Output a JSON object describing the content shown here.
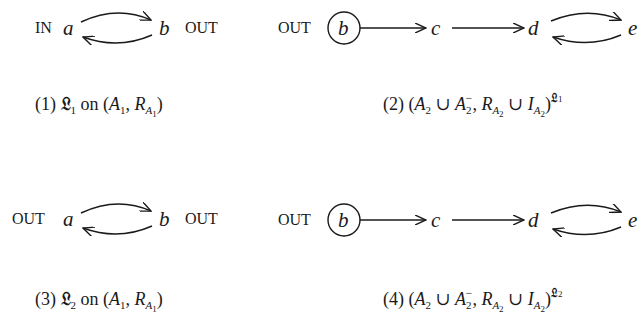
{
  "panels": [
    {
      "id": 1,
      "nodes": [
        {
          "name": "a",
          "label": "a",
          "status": "IN"
        },
        {
          "name": "b",
          "label": "b",
          "status": "OUT"
        }
      ],
      "edges": [
        [
          "a",
          "b"
        ],
        [
          "b",
          "a"
        ]
      ],
      "caption": {
        "number": "(1)",
        "labelling": "𝔏",
        "labelling_index": "1",
        "on": "on",
        "text": "(1) 𝔏1 on (A1, RA1)"
      }
    },
    {
      "id": 2,
      "nodes": [
        {
          "name": "b",
          "label": "b",
          "status": "OUT",
          "circled": true
        },
        {
          "name": "c",
          "label": "c"
        },
        {
          "name": "d",
          "label": "d"
        },
        {
          "name": "e",
          "label": "e"
        }
      ],
      "edges": [
        [
          "b",
          "c"
        ],
        [
          "c",
          "d"
        ],
        [
          "d",
          "e"
        ],
        [
          "e",
          "d"
        ]
      ],
      "caption": {
        "number": "(2)",
        "labelling": "𝔏",
        "labelling_index": "1",
        "text": "(2) (A2 ∪ A2⁻, RA2 ∪ IA2)^𝔏1"
      }
    },
    {
      "id": 3,
      "nodes": [
        {
          "name": "a",
          "label": "a",
          "status": "OUT"
        },
        {
          "name": "b",
          "label": "b",
          "status": "OUT"
        }
      ],
      "edges": [
        [
          "a",
          "b"
        ],
        [
          "b",
          "a"
        ]
      ],
      "caption": {
        "number": "(3)",
        "labelling": "𝔏",
        "labelling_index": "2",
        "on": "on",
        "text": "(3) 𝔏2 on (A1, RA1)"
      }
    },
    {
      "id": 4,
      "nodes": [
        {
          "name": "b",
          "label": "b",
          "status": "OUT",
          "circled": true
        },
        {
          "name": "c",
          "label": "c"
        },
        {
          "name": "d",
          "label": "d"
        },
        {
          "name": "e",
          "label": "e"
        }
      ],
      "edges": [
        [
          "b",
          "c"
        ],
        [
          "c",
          "d"
        ],
        [
          "d",
          "e"
        ],
        [
          "e",
          "d"
        ]
      ],
      "caption": {
        "number": "(4)",
        "labelling": "𝔏",
        "labelling_index": "2",
        "text": "(4) (A2 ∪ A2⁻, RA2 ∪ IA2)^𝔏2"
      }
    }
  ],
  "symbols": {
    "A": "A",
    "R": "R",
    "I": "I",
    "one": "1",
    "two": "2",
    "union": "∪",
    "minus": "−",
    "comma": ",",
    "lparen": "(",
    "rparen": ")"
  }
}
